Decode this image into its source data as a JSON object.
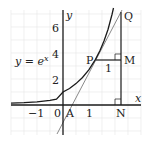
{
  "diagram": {
    "curve_label": {
      "lhs": "y",
      "eq": " = ",
      "base": "e",
      "exp": "x"
    },
    "axes": {
      "x_label": "x",
      "y_label": "y",
      "x_ticks": [
        "−1",
        "0",
        "1"
      ],
      "y_ticks": [
        "2",
        "4",
        "6"
      ]
    },
    "points": {
      "A": "A",
      "P": "P",
      "Q": "Q",
      "M": "M",
      "N": "N"
    },
    "segment_label_PM": "1",
    "colors": {
      "curve": "#1a1a1a",
      "tangent": "#8a8a8a",
      "grid": "#e6e6e6"
    }
  }
}
